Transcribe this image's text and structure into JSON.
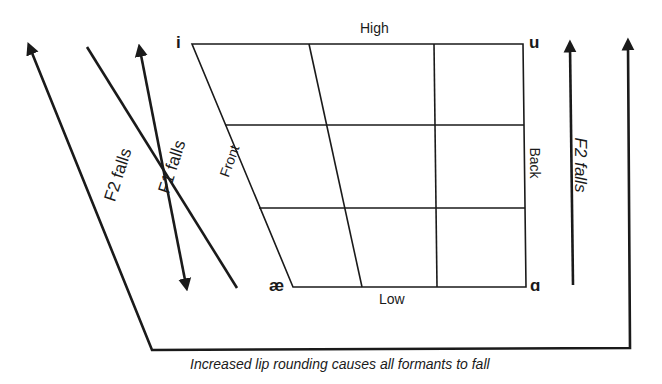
{
  "diagram": {
    "type": "vowel-quadrilateral",
    "vowels": {
      "top_left": "i",
      "top_right": "u",
      "bottom_left": "æ",
      "bottom_right": "ɑ"
    },
    "axes": {
      "top": "High",
      "bottom": "Low",
      "left": "Front",
      "right": "Back"
    },
    "arrows": {
      "f2_left_label": "F2 falls",
      "f1_label": "F1 falls",
      "f2_right_label": "F2 falls"
    },
    "caption": "Increased lip rounding causes all formants to fall",
    "stroke_color": "#1a1a1a",
    "background": "#ffffff"
  }
}
